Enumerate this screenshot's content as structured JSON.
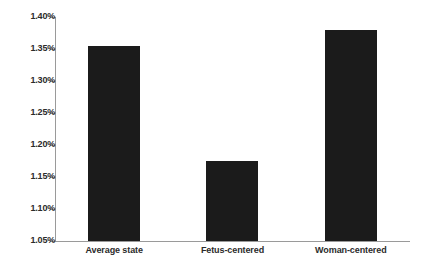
{
  "chart_data": {
    "type": "bar",
    "title": "",
    "subtitle": "",
    "xlabel": "",
    "ylabel": "",
    "categories": [
      "Average state",
      "Fetus-centered",
      "Woman-centered"
    ],
    "values": [
      1.355,
      1.175,
      1.38
    ],
    "value_unit": "%",
    "ylim": [
      1.05,
      1.4
    ],
    "ytick_labels": [
      "1.40%",
      "1.35%",
      "1.30%",
      "1.25%",
      "1.20%",
      "1.15%",
      "1.10%",
      "1.05%"
    ],
    "ytick_values": [
      1.4,
      1.35,
      1.3,
      1.25,
      1.2,
      1.15,
      1.1,
      1.05
    ],
    "grid": false,
    "legend": false,
    "legend_position": "none",
    "bar_color": "#1b1b1b",
    "axis_color": "#9a9a9a",
    "background_color": "#ffffff",
    "series": [
      {
        "name": "Rate",
        "values": [
          1.355,
          1.175,
          1.38
        ]
      }
    ]
  }
}
